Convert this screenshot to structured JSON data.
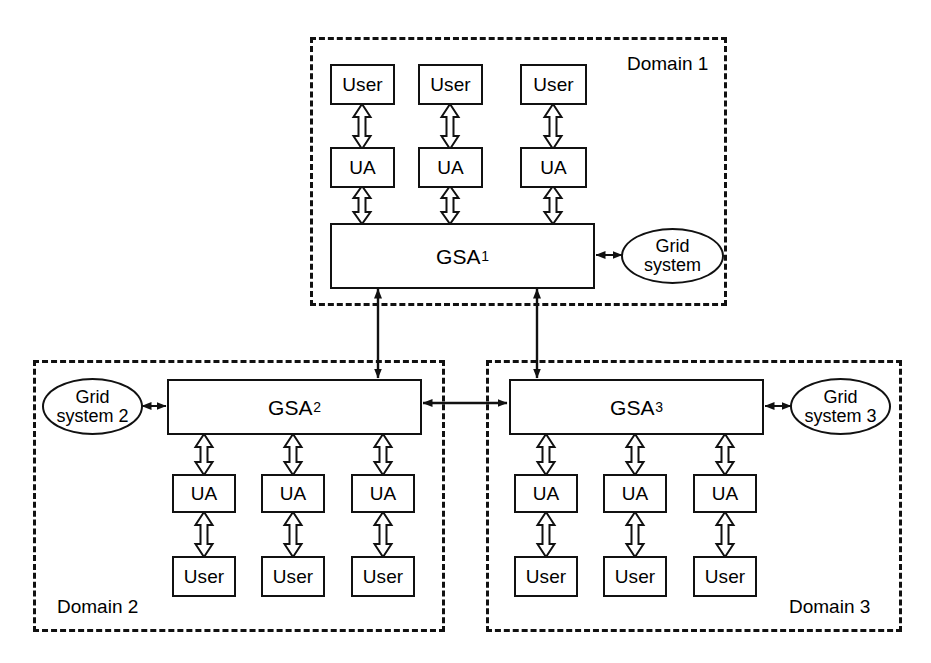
{
  "diagram": {
    "type": "block-diagram",
    "colors": {
      "stroke": "#111111",
      "fill": "#ffffff",
      "background": "#ffffff"
    },
    "domains": [
      {
        "id": "domain1",
        "label": "Domain 1",
        "gsa": "GSA",
        "gsa_subscript": "1",
        "grid_system": "Grid system",
        "grid_system_line1": "Grid",
        "grid_system_line2": "system",
        "users": [
          "User",
          "User",
          "User"
        ],
        "agents": [
          "UA",
          "UA",
          "UA"
        ],
        "layout": "users-top"
      },
      {
        "id": "domain2",
        "label": "Domain 2",
        "gsa": "GSA",
        "gsa_subscript": "2",
        "grid_system": "Grid system 2",
        "grid_system_line1": "Grid",
        "grid_system_line2": "system 2",
        "users": [
          "User",
          "User",
          "User"
        ],
        "agents": [
          "UA",
          "UA",
          "UA"
        ],
        "layout": "users-bottom"
      },
      {
        "id": "domain3",
        "label": "Domain 3",
        "gsa": "GSA",
        "gsa_subscript": "3",
        "grid_system": "Grid system 3",
        "grid_system_line1": "Grid",
        "grid_system_line2": "system 3",
        "users": [
          "User",
          "User",
          "User"
        ],
        "agents": [
          "UA",
          "UA",
          "UA"
        ],
        "layout": "users-bottom"
      }
    ],
    "connectors": {
      "user_to_ua": "bidirectional hollow arrow",
      "ua_to_gsa": "bidirectional hollow arrow",
      "gsa_to_grid_system": "bidirectional line arrow",
      "gsa1_to_gsa2": "bidirectional line arrow",
      "gsa1_to_gsa3": "bidirectional line arrow",
      "gsa2_to_gsa3": "bidirectional line arrow"
    }
  }
}
